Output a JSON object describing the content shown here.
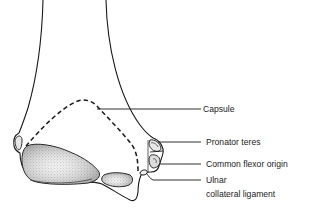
{
  "figure": {
    "labels": [
      {
        "id": "capsule",
        "text": "Capsule"
      },
      {
        "id": "pronator_teres",
        "text": "Pronator teres"
      },
      {
        "id": "common_flexor_origin",
        "text": "Common flexor origin"
      },
      {
        "id": "ulnar_collateral_ligament_line1",
        "text": "Ulnar"
      },
      {
        "id": "ulnar_collateral_ligament_line2",
        "text": "collateral ligament"
      }
    ]
  },
  "colors": {
    "line": "#1a1a1a",
    "stipple": "#9a9a9a",
    "background": "#ffffff"
  }
}
